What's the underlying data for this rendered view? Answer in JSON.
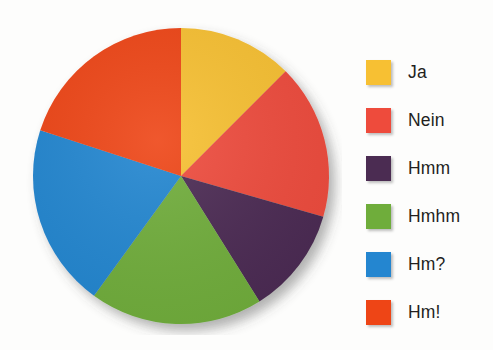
{
  "chart_data": {
    "type": "pie",
    "title": "",
    "subtitle": "",
    "xlabel": "",
    "ylabel": "",
    "grid": false,
    "legend_position": "right",
    "start_angle_deg": 0,
    "direction": "clockwise",
    "categories": [
      "Ja",
      "Nein",
      "Hmm",
      "Hmhm",
      "Hm?",
      "Hm!"
    ],
    "values": [
      12.5,
      17.0,
      11.5,
      19.0,
      20.0,
      20.0
    ],
    "units": "percent",
    "slices": [
      {
        "label": "Ja",
        "value": 12.5,
        "color": "#F7C033",
        "start_deg": 0,
        "end_deg": 45
      },
      {
        "label": "Nein",
        "value": 17.0,
        "color": "#EE4B3C",
        "start_deg": 45,
        "end_deg": 106
      },
      {
        "label": "Hmm",
        "value": 11.5,
        "color": "#4B2C52",
        "start_deg": 106,
        "end_deg": 148
      },
      {
        "label": "Hmhm",
        "value": 19.0,
        "color": "#6FAD3B",
        "start_deg": 148,
        "end_deg": 216
      },
      {
        "label": "Hm?",
        "value": 20.0,
        "color": "#2486D0",
        "start_deg": 216,
        "end_deg": 288
      },
      {
        "label": "Hm!",
        "value": 20.0,
        "color": "#EE4516",
        "start_deg": 288,
        "end_deg": 360
      }
    ]
  },
  "legend": {
    "items": [
      {
        "label": "Ja",
        "color": "#F7C033"
      },
      {
        "label": "Nein",
        "color": "#EE4B3C"
      },
      {
        "label": "Hmm",
        "color": "#4B2C52"
      },
      {
        "label": "Hmhm",
        "color": "#6FAD3B"
      },
      {
        "label": "Hm?",
        "color": "#2486D0"
      },
      {
        "label": "Hm!",
        "color": "#EE4516"
      }
    ]
  },
  "colors": {
    "background": "#FDFDFC",
    "text": "#231F1D",
    "yellow": "#F7C033",
    "red": "#EE4B3C",
    "purple": "#4B2C52",
    "green": "#6FAD3B",
    "blue": "#2486D0",
    "orange": "#EE4516"
  }
}
